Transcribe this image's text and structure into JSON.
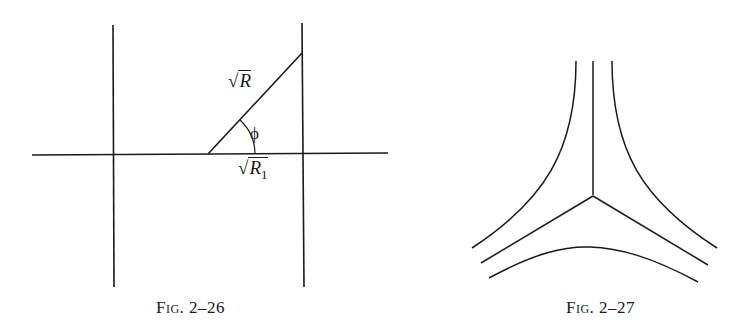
{
  "figures": [
    {
      "id": "fig-2-26",
      "caption": "Fig. 2–26",
      "labels": {
        "hypotenuse": {
          "radical": "√",
          "radicand": "R"
        },
        "base": {
          "radical": "√",
          "radicand": "R",
          "subscript": "1"
        },
        "angle": "ϕ"
      }
    },
    {
      "id": "fig-2-27",
      "caption": "Fig. 2–27"
    }
  ]
}
